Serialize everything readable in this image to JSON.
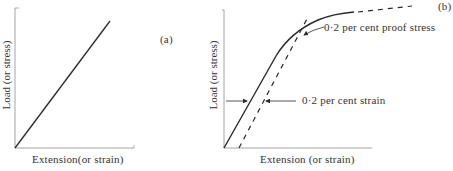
{
  "figure": {
    "panel_a": {
      "tag": "(a)",
      "xlabel": "Extension(or strain)",
      "ylabel": "Load (or stress)",
      "description": "linear load-extension"
    },
    "panel_b": {
      "tag": "(b)",
      "xlabel": "Extension (or strain)",
      "ylabel": "Load (or stress)",
      "annotations": {
        "proof_stress": "0·2 per cent proof stress",
        "offset_strain": "0·2 per cent strain"
      }
    },
    "colors": {
      "line": "#2a2a2a",
      "axis": "#9a9a9a",
      "background": "#ffffff"
    }
  }
}
